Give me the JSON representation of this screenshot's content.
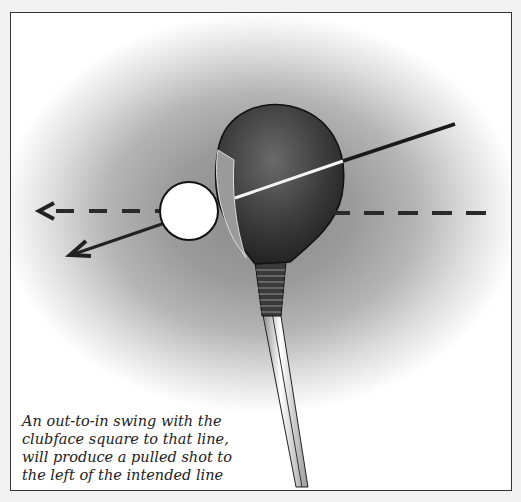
{
  "illustration": {
    "subject": "golf-driver-out-to-in-swing",
    "caption": "An out-to-in swing with the clubface square to that line, will produce a pulled shot to the left of the intended line",
    "caption_lines": [
      "An out-to-in swing with the",
      "clubface square to that line,",
      "will produce a pulled shot to",
      "the left of the intended line"
    ],
    "colors": {
      "background": "#f2f2f2",
      "frame_border": "#333333",
      "arrow": "#222222",
      "ball": "#ffffff"
    }
  }
}
